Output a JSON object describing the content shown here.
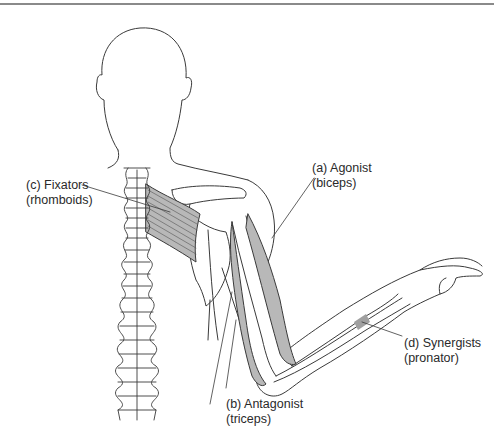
{
  "figure": {
    "colors": {
      "outline": "#3a3a3a",
      "muscle_fill": "#b8b8b8",
      "background": "#ffffff",
      "rule": "#8a8a8a"
    },
    "labels": {
      "agonist": {
        "line1": "(a) Agonist",
        "line2": "(biceps)"
      },
      "antagonist": {
        "line1": "(b) Antagonist",
        "line2": "(triceps)"
      },
      "fixators": {
        "line1": "(c) Fixators",
        "line2": "(rhomboids)"
      },
      "synergists": {
        "line1": "(d) Synergists",
        "line2": "(pronator)"
      }
    }
  }
}
